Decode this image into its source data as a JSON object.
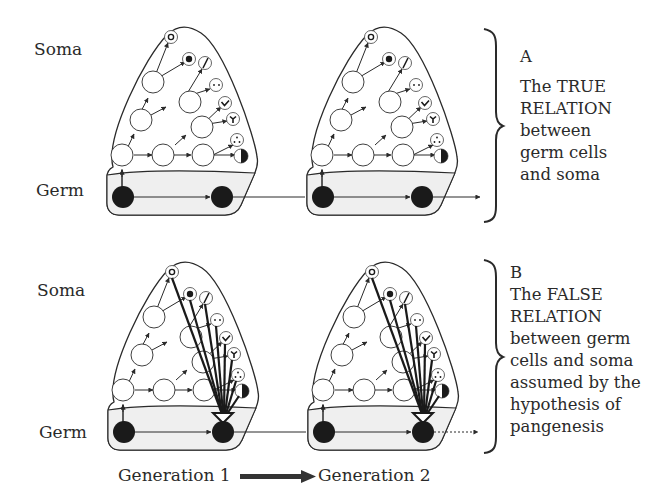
{
  "figure": {
    "row_labels": {
      "a_soma": "Soma",
      "a_germ": "Germ",
      "b_soma": "Soma",
      "b_germ": "Germ"
    },
    "panel_a": {
      "letter": "A",
      "caption_lines": [
        "The TRUE",
        "RELATION",
        "between",
        "germ cells",
        "and soma"
      ]
    },
    "panel_b": {
      "letter": "B",
      "caption_lines": [
        "The FALSE",
        "RELATION",
        "between germ",
        "cells and soma",
        "assumed by the",
        "hypothesis of",
        "pangenesis"
      ]
    },
    "generations": {
      "from": "Generation 1",
      "to": "Generation 2"
    },
    "cell_symbols": [
      "ring-dot",
      "filled-dot",
      "slash",
      "two-dots",
      "chevron",
      "y-shape",
      "three-dots",
      "half-filled"
    ],
    "colors": {
      "ink": "#2a2a2a",
      "germ_band": "#efefef",
      "germ_cell": "#1a1a1a",
      "cell_fill": "#ffffff"
    }
  }
}
